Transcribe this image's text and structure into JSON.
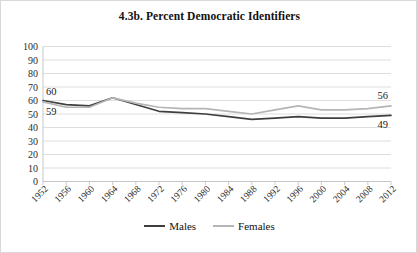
{
  "chart_data": {
    "type": "line",
    "title": "4.3b. Percent Democratic Identifiers",
    "xlabel": "",
    "ylabel": "",
    "ylim": [
      0,
      100
    ],
    "ytick_step": 10,
    "grid": true,
    "legend_position": "bottom",
    "categories": [
      "1952",
      "1956",
      "1960",
      "1964",
      "1968",
      "1972",
      "1976",
      "1980",
      "1984",
      "1988",
      "1992",
      "1996",
      "2000",
      "2004",
      "2008",
      "2012"
    ],
    "yticks": [
      "100",
      "90",
      "80",
      "70",
      "60",
      "50",
      "40",
      "30",
      "20",
      "10",
      "0"
    ],
    "series": [
      {
        "name": "Males",
        "color": "#3f3f3f",
        "values": [
          60,
          57,
          56,
          62,
          57,
          52,
          51,
          50,
          48,
          46,
          47,
          48,
          47,
          47,
          48,
          49
        ]
      },
      {
        "name": "Females",
        "color": "#b5b5b5",
        "values": [
          59,
          55,
          55,
          62,
          58,
          55,
          54,
          54,
          52,
          50,
          53,
          56,
          53,
          53,
          54,
          56
        ]
      }
    ],
    "annotations": [
      {
        "text": "60",
        "series": "Males",
        "category": "1952",
        "position": "above-left"
      },
      {
        "text": "59",
        "series": "Females",
        "category": "1952",
        "position": "below-left"
      },
      {
        "text": "56",
        "series": "Females",
        "category": "2012",
        "position": "above-right"
      },
      {
        "text": "49",
        "series": "Males",
        "category": "2012",
        "position": "below-right"
      }
    ]
  },
  "legend": {
    "entries": [
      {
        "label": "Males"
      },
      {
        "label": "Females"
      }
    ]
  }
}
